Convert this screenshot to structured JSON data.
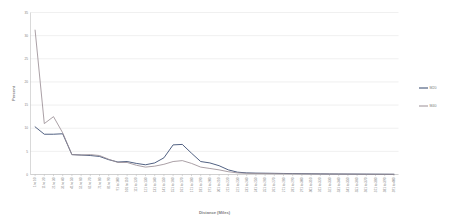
{
  "chart_data": {
    "type": "line",
    "title": "",
    "xlabel": "Distance (Miles)",
    "ylabel": "Percent",
    "ylim": [
      0,
      35
    ],
    "yticks": [
      0,
      5,
      10,
      15,
      20,
      25,
      30,
      35
    ],
    "grid": true,
    "legend_position": "right",
    "categories": [
      "1 to 10",
      "11 to 20",
      "21 to 30",
      "31 to 40",
      "41 to 50",
      "51 to 60",
      "61 to 70",
      "71 to 80",
      "81 to 90",
      "91 to 100",
      "101 to 110",
      "111 to 120",
      "121 to 130",
      "131 to 140",
      "141 to 150",
      "151 to 160",
      "161 to 170",
      "171 to 180",
      "181 to 190",
      "191 to 200",
      "201 to 210",
      "211 to 220",
      "221 to 230",
      "231 to 240",
      "241 to 250",
      "251 to 260",
      "261 to 270",
      "271 to 280",
      "281 to 290",
      "291 to 300",
      "301 to 310",
      "311 to 320",
      "321 to 330",
      "331 to 340",
      "341 to 350",
      "351 to 360",
      "361 to 370",
      "371 to 380",
      "381 to 390",
      "391 to 400"
    ],
    "series": [
      {
        "name": "M20",
        "color": "#31456b",
        "values": [
          10.3,
          8.7,
          8.7,
          8.8,
          4.3,
          4.2,
          4.1,
          3.9,
          3.2,
          2.7,
          2.8,
          2.4,
          2.1,
          2.5,
          3.6,
          6.4,
          6.5,
          4.6,
          2.8,
          2.5,
          1.9,
          1.0,
          0.5,
          0.35,
          0.3,
          0.28,
          0.25,
          0.22,
          0.2,
          0.18,
          0.16,
          0.14,
          0.12,
          0.11,
          0.1,
          0.09,
          0.08,
          0.07,
          0.06,
          0.05
        ]
      },
      {
        "name": "M40",
        "color": "#9b8f96",
        "values": [
          31.2,
          11.0,
          12.5,
          9.0,
          4.3,
          4.2,
          4.3,
          4.1,
          3.3,
          2.6,
          2.6,
          2.0,
          1.6,
          1.8,
          2.2,
          2.8,
          3.0,
          2.4,
          1.6,
          1.3,
          1.0,
          0.6,
          0.35,
          0.25,
          0.22,
          0.2,
          0.18,
          0.16,
          0.15,
          0.13,
          0.12,
          0.11,
          0.1,
          0.09,
          0.08,
          0.07,
          0.06,
          0.05,
          0.05,
          0.04
        ]
      }
    ]
  }
}
